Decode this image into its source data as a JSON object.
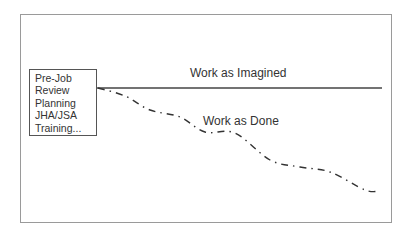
{
  "diagram": {
    "type": "work-as-imagined-vs-done",
    "frame": {
      "border_color": "#9a9a9a"
    },
    "planning_box": {
      "items": [
        "Pre-Job",
        "Review",
        "Planning",
        "JHA/JSA",
        "Training..."
      ]
    },
    "lines": {
      "imagined": {
        "label": "Work as Imagined",
        "style": "solid",
        "color": "#444444",
        "points": [
          [
            97,
            88
          ],
          [
            382,
            88
          ]
        ]
      },
      "done": {
        "label": "Work as Done",
        "style": "dash-dot",
        "color": "#333333",
        "points": [
          [
            98,
            88
          ],
          [
            125,
            96
          ],
          [
            150,
            110
          ],
          [
            180,
            117
          ],
          [
            205,
            132
          ],
          [
            235,
            133
          ],
          [
            270,
            160
          ],
          [
            300,
            167
          ],
          [
            330,
            172
          ],
          [
            365,
            190
          ],
          [
            380,
            191
          ]
        ]
      }
    }
  }
}
